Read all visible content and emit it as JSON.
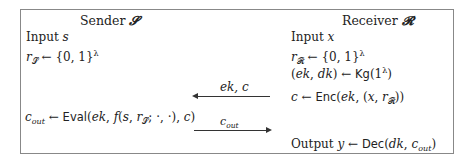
{
  "figure": {
    "type": "protocol-diagram",
    "sender": {
      "header": "Sender 𝓢",
      "lines": [
        "Input s",
        "r𝓢 ← {0,1}^λ",
        "c_out ← Eval(ek, f(s, r𝓢; ·,·), c)"
      ]
    },
    "receiver": {
      "header": "Receiver 𝓡",
      "lines": [
        "Input x",
        "r𝓡 ← {0,1}^λ",
        "(ek, dk) ← Kg(1^λ)",
        "c ← Enc(ek, (x, r𝓡))",
        "Output y ← Dec(dk, c_out)"
      ]
    },
    "messages": [
      {
        "label": "ek, c",
        "direction": "receiver-to-sender"
      },
      {
        "label": "c_out",
        "direction": "sender-to-receiver"
      }
    ]
  }
}
